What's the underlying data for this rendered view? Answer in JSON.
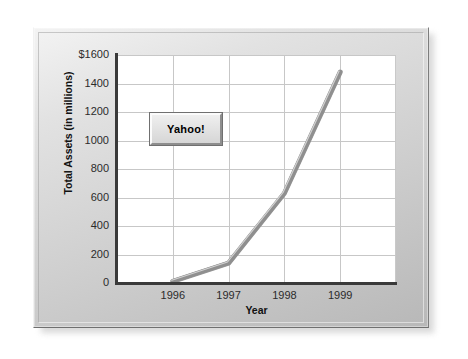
{
  "chart_data": {
    "type": "line",
    "title": "",
    "xlabel": "Year",
    "ylabel": "Total Assets (in millions)",
    "categories": [
      "1996",
      "1997",
      "1998",
      "1999"
    ],
    "series": [
      {
        "name": "Yahoo!",
        "values": [
          12,
          140,
          630,
          1480
        ]
      }
    ],
    "ylim": [
      0,
      1600
    ],
    "ytick_labels": [
      "$1600",
      "1400",
      "1200",
      "1000",
      "800",
      "600",
      "400",
      "200",
      "0"
    ],
    "ytick_values": [
      1600,
      1400,
      1200,
      1000,
      800,
      600,
      400,
      200,
      0
    ],
    "xtick_labels": [
      "1996",
      "1997",
      "1998",
      "1999"
    ],
    "grid": true,
    "legend_position": "inside-upper-left",
    "colors": {
      "line": "#8f8f8f",
      "line_highlight": "#d2d2d2",
      "gridline": "#c7c7c7",
      "axis": "#3a3a3a",
      "plot_background": "#ffffff",
      "frame": "#d0d0d0",
      "legend_fill": "#e3e3e3",
      "text": "#111111"
    }
  },
  "legend": {
    "label": "Yahoo!"
  },
  "axes": {
    "y_title": "Total Assets (in millions)",
    "x_title": "Year"
  }
}
